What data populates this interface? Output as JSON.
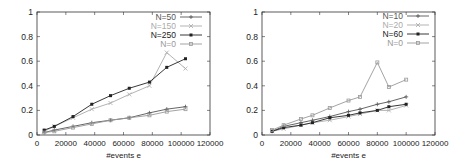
{
  "chart_data": [
    {
      "type": "line",
      "title": "",
      "xlabel": "#events e",
      "ylabel": "",
      "xlim": [
        0,
        120000
      ],
      "ylim": [
        0,
        1
      ],
      "xticks": [
        0,
        20000,
        40000,
        60000,
        80000,
        100000,
        120000
      ],
      "yticks": [
        0,
        0.2,
        0.4,
        0.6,
        0.8,
        1
      ],
      "xtick_labels": [
        "0",
        "20000",
        "40000",
        "60000",
        "80000",
        "100000",
        "120000"
      ],
      "ytick_labels": [
        "0",
        "0.2",
        "0.4",
        "0.6",
        "0.8",
        "1"
      ],
      "grid": false,
      "legend_position": "top-right",
      "x": [
        5000,
        12000,
        25000,
        38000,
        51000,
        64000,
        78000,
        90000,
        103000
      ],
      "series": [
        {
          "name": "N=50",
          "color": "#555555",
          "marker": "plus",
          "values": [
            0.02,
            0.04,
            0.07,
            0.1,
            0.12,
            0.14,
            0.18,
            0.21,
            0.23
          ]
        },
        {
          "name": "N=150",
          "color": "#aaaaaa",
          "marker": "x",
          "values": [
            0.03,
            0.07,
            0.14,
            0.21,
            0.26,
            0.33,
            0.4,
            0.67,
            0.54
          ]
        },
        {
          "name": "N=250",
          "color": "#222222",
          "marker": "square",
          "values": [
            0.04,
            0.07,
            0.15,
            0.25,
            0.32,
            0.38,
            0.43,
            0.55,
            0.62
          ]
        },
        {
          "name": "N=0",
          "color": "#999999",
          "marker": "square-open",
          "values": [
            0.02,
            0.03,
            0.06,
            0.09,
            0.12,
            0.14,
            0.16,
            0.19,
            0.21
          ]
        }
      ]
    },
    {
      "type": "line",
      "title": "",
      "xlabel": "#events e",
      "ylabel": "",
      "xlim": [
        0,
        120000
      ],
      "ylim": [
        0,
        1
      ],
      "xticks": [
        0,
        20000,
        40000,
        60000,
        80000,
        100000,
        120000
      ],
      "yticks": [
        0,
        0.2,
        0.4,
        0.6,
        0.8,
        1
      ],
      "xtick_labels": [
        "0",
        "20000",
        "40000",
        "60000",
        "80000",
        "100000",
        "120000"
      ],
      "ytick_labels": [
        "0",
        "0.2",
        "0.4",
        "0.6",
        "0.8",
        "1"
      ],
      "grid": false,
      "legend_position": "top-right",
      "x": [
        7000,
        15000,
        27000,
        35000,
        47000,
        60000,
        68000,
        80000,
        88000,
        100000
      ],
      "series": [
        {
          "name": "N=10",
          "color": "#555555",
          "marker": "plus",
          "values": [
            0.03,
            0.07,
            0.1,
            0.12,
            0.15,
            0.19,
            0.21,
            0.25,
            0.27,
            0.31
          ]
        },
        {
          "name": "N=20",
          "color": "#aaaaaa",
          "marker": "x",
          "values": [
            0.03,
            0.05,
            0.08,
            0.1,
            0.12,
            0.15,
            0.17,
            0.2,
            0.2,
            0.24
          ]
        },
        {
          "name": "N=60",
          "color": "#222222",
          "marker": "square",
          "values": [
            0.03,
            0.06,
            0.08,
            0.1,
            0.14,
            0.16,
            0.18,
            0.2,
            0.23,
            0.25
          ]
        },
        {
          "name": "N=0",
          "color": "#999999",
          "marker": "square-open",
          "values": [
            0.04,
            0.08,
            0.13,
            0.16,
            0.22,
            0.28,
            0.31,
            0.59,
            0.39,
            0.45
          ]
        }
      ]
    }
  ],
  "panels": [
    {
      "xlabel": "#events e"
    },
    {
      "xlabel": "#events e"
    }
  ]
}
